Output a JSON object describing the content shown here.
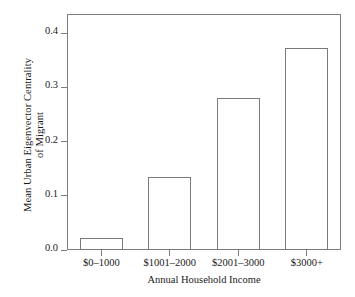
{
  "chart_data": {
    "type": "bar",
    "title": "",
    "xlabel": "Annual Household Income",
    "ylabel_line1": "Mean Urban Eigenvector Centrality",
    "ylabel_line2": "of Migrant",
    "categories": [
      "$0–1000",
      "$1001–2000",
      "$2001–3000",
      "$3000+"
    ],
    "values": [
      0.022,
      0.135,
      0.281,
      0.372
    ],
    "ylim": [
      0.0,
      0.4355
    ],
    "yticks": [
      0.0,
      0.1,
      0.2,
      0.3,
      0.4
    ],
    "ytick_labels": [
      "0.0",
      "0.1",
      "0.2",
      "0.3",
      "0.4"
    ],
    "grid": false,
    "legend": null,
    "bar_fill": "#ffffff",
    "bar_stroke": "#7a7a7a",
    "axis_color": "#7d7d7d",
    "background": "#ffffff",
    "text_color": "#1a1a1a"
  }
}
